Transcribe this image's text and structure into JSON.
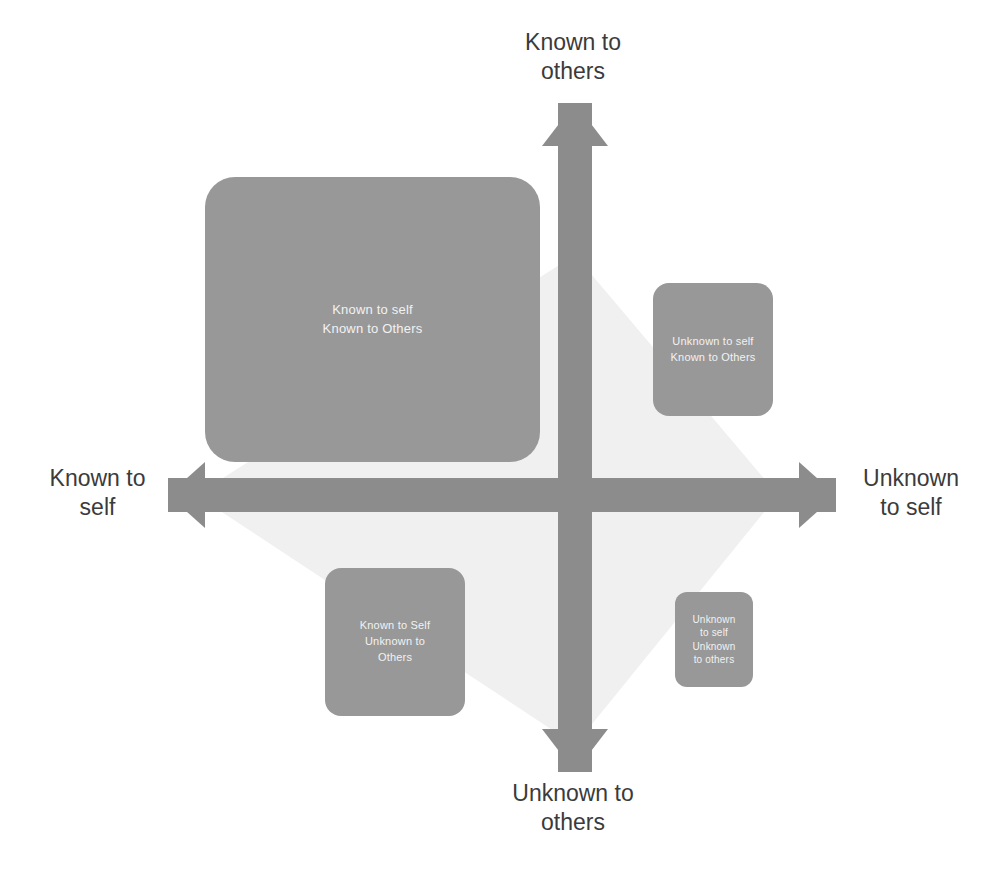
{
  "diagram": {
    "name": "Johari Window",
    "colors": {
      "box_fill": "#989898",
      "arrow_fill": "#8c8c8c",
      "diamond_fill": "#f0f0f0",
      "box_text": "#f2f2f2",
      "label_text": "#3b3b3b",
      "background": "#ffffff"
    }
  },
  "axes": {
    "top": {
      "line1": "Known to",
      "line2": "others"
    },
    "bottom": {
      "line1": "Unknown to",
      "line2": "others"
    },
    "left": {
      "line1": "Known to",
      "line2": "self"
    },
    "right": {
      "line1": "Unknown",
      "line2": "to self"
    }
  },
  "quadrants": [
    {
      "id": "open",
      "line1": "Known to self",
      "line2": "Known to Others",
      "line3": ""
    },
    {
      "id": "blind",
      "line1": "Unknown to self",
      "line2": "Known to Others",
      "line3": ""
    },
    {
      "id": "hidden",
      "line1": "Known to Self",
      "line2": "Unknown to",
      "line3": "Others"
    },
    {
      "id": "unknown",
      "line1": "Unknown",
      "line2": "to self",
      "line3": "Unknown",
      "line4": "to others"
    }
  ],
  "arrows": [
    {
      "name": "up-arrow",
      "direction": "up"
    },
    {
      "name": "down-arrow",
      "direction": "down"
    },
    {
      "name": "left-arrow",
      "direction": "left"
    },
    {
      "name": "right-arrow",
      "direction": "right"
    }
  ]
}
